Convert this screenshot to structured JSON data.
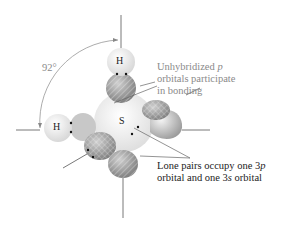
{
  "diagram": {
    "angle_label": "92°",
    "atoms": {
      "hydrogen_top": "H",
      "hydrogen_left": "H",
      "sulfur": "S"
    },
    "annotations": {
      "bonding": {
        "line1_prefix": "Unhybridized ",
        "line1_italic": "p",
        "line2": "orbitals participate",
        "line3": "in bonding"
      },
      "lone_pairs": {
        "line1_prefix": "Lone pairs occupy one 3",
        "line1_italic": "p",
        "line2_prefix": "orbital and one 3",
        "line2_italic": "s",
        "line2_suffix": " orbital"
      }
    },
    "colors": {
      "annotation_gray": "#8a8a8a",
      "text_dark": "#222222",
      "orbital_gray": "#9a9a9a",
      "hydrogen_light": "#eeeeee",
      "sulfur_light": "#f2f2f2"
    }
  }
}
